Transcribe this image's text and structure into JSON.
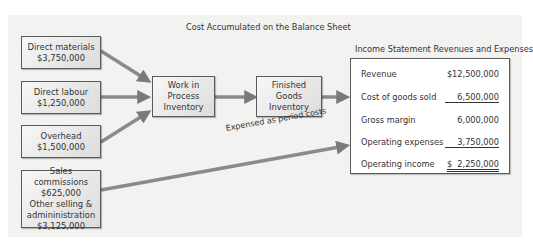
{
  "titles": {
    "balance_sheet": "Cost Accumulated on the Balance Sheet",
    "income_statement": "Income Statement Revenues and Expenses"
  },
  "cost_boxes": [
    {
      "label": "Direct materials",
      "amount": "$3,750,000"
    },
    {
      "label": "Direct labour",
      "amount": "$1,250,000"
    },
    {
      "label": "Overhead",
      "amount": "$1,500,000"
    }
  ],
  "period_box": {
    "line1": "Sales commissions",
    "line2": "$625,000",
    "line3": "Other selling &",
    "line4": "admininistration",
    "line5": "$3,125,000"
  },
  "wip_box": {
    "line1": "Work in",
    "line2": "Process",
    "line3": "Inventory"
  },
  "fg_box": {
    "line1": "Finished",
    "line2": "Goods",
    "line3": "Inventory"
  },
  "period_arrow_label": "Expensed as period costs",
  "income_statement": {
    "rows": [
      {
        "label": "Revenue",
        "value": "$12,500,000"
      },
      {
        "label": "Cost of goods sold",
        "value": "6,500,000"
      },
      {
        "label": "Gross margin",
        "value": "6,000,000"
      },
      {
        "label": "Operating expenses",
        "value": "3,750,000"
      },
      {
        "label": "Operating income",
        "value": "$  2,250,000"
      }
    ]
  }
}
